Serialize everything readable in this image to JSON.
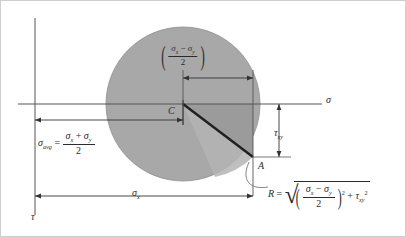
{
  "figure": {
    "name": "mohrs-circle-diagram",
    "ghost_title": "CHAPTER REVIEW",
    "colors": {
      "circle_fill": "#a8a8a8",
      "wedge_fill": "#9a9a9a",
      "line": "#2b2b2b",
      "thin_line": "#555555",
      "background": "#ffffff",
      "border": "#cfcfcf"
    }
  },
  "axes": {
    "sigma_label": "σ",
    "tau_label": "τ"
  },
  "points": {
    "center_label": "C",
    "point_a_label": "A"
  },
  "labels": {
    "sigma_avg": {
      "lhs": "σ",
      "lhs_sub": "avg",
      "equals": "=",
      "numerator_a": "σ",
      "numerator_a_sub": "x",
      "numerator_op": "+",
      "numerator_b": "σ",
      "numerator_b_sub": "y",
      "denominator": "2"
    },
    "sigma_deviator": {
      "numerator_a": "σ",
      "numerator_a_sub": "x",
      "numerator_op": "−",
      "numerator_b": "σ",
      "numerator_b_sub": "y",
      "denominator": "2"
    },
    "sigma_x": {
      "symbol": "σ",
      "sub": "x"
    },
    "tau_xy": {
      "symbol": "τ",
      "sub": "xy"
    },
    "radius_equation": {
      "lhs": "R",
      "equals": "=",
      "numerator_a": "σ",
      "numerator_a_sub": "x",
      "numerator_op": "−",
      "numerator_b": "σ",
      "numerator_b_sub": "y",
      "denominator": "2",
      "paren_exponent": "2",
      "plus": "+",
      "tau_symbol": "τ",
      "tau_sub": "xy",
      "tau_exponent": "2"
    }
  },
  "geometry": {
    "circle_center_x": 183,
    "circle_center_y": 104,
    "circle_radius": 77,
    "tau_axis_x": 35,
    "sigma_axis_y": 104,
    "point_a_x": 253,
    "point_a_y": 157
  }
}
